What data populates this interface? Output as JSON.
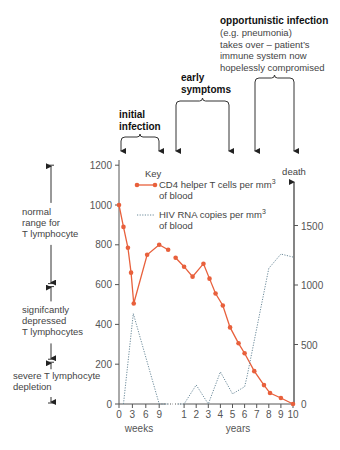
{
  "chart_data": {
    "type": "line",
    "title": "",
    "xlabel_left": "weeks",
    "xlabel_right": "years",
    "ylabel_left": "CD4 helper T cells per mm3 of blood",
    "ylabel_right": "HIV RNA copies per mm3 of blood",
    "ylim_left": [
      0,
      1200
    ],
    "ylim_right": [
      0,
      1700
    ],
    "yticks_left": [
      0,
      200,
      400,
      600,
      800,
      1000,
      1200
    ],
    "yticks_right": [
      0,
      500,
      1000,
      1500
    ],
    "xticks_weeks": [
      0,
      3,
      6,
      9
    ],
    "xticks_years": [
      1,
      2,
      3,
      4,
      5,
      6,
      7,
      8,
      9,
      10
    ],
    "legend": {
      "title": "Key",
      "entries": [
        {
          "label": "CD4 helper T cells per mm",
          "sup": "3",
          "label2": "of blood",
          "style": "solid-dot",
          "color": "#e8603c"
        },
        {
          "label": "HIV RNA copies per mm",
          "sup": "3",
          "label2": "of blood",
          "style": "dotted",
          "color": "#6b8a9a"
        }
      ]
    },
    "series": [
      {
        "name": "CD4 helper T cells per mm3 of blood",
        "axis": "left",
        "segments": [
          {
            "unit": "weeks",
            "x": [
              0,
              1,
              2,
              2.7,
              3.3,
              6.3,
              9,
              11
            ],
            "y": [
              1000,
              890,
              785,
              660,
              505,
              750,
              800,
              775
            ]
          },
          {
            "unit": "years",
            "x": [
              0.3,
              1,
              1.7,
              2.6,
              3.1,
              3.6,
              4.2,
              4.8,
              5.5,
              6,
              6.8,
              7.6,
              8.1,
              9,
              10
            ],
            "y": [
              735,
              690,
              640,
              705,
              630,
              555,
              495,
              385,
              305,
              255,
              165,
              95,
              55,
              30,
              0
            ]
          }
        ]
      },
      {
        "name": "HIV RNA copies per mm3 of blood",
        "axis": "right",
        "segments": [
          {
            "unit": "weeks",
            "x": [
              1,
              3.2,
              9,
              11
            ],
            "y": [
              0,
              760,
              0,
              0
            ]
          },
          {
            "unit": "years",
            "x": [
              0.5,
              1,
              2,
              3,
              4,
              5,
              6,
              6.2,
              8,
              9,
              10
            ],
            "y": [
              0,
              0,
              160,
              0,
              270,
              85,
              145,
              230,
              1140,
              1260,
              1235
            ]
          }
        ]
      }
    ],
    "annotations": {
      "phases": [
        {
          "lines": [
            "initial",
            "infection"
          ],
          "from_x_week": 0,
          "to_x_week": 9
        },
        {
          "lines": [
            "early",
            "symptoms"
          ],
          "from_x_year": 0.5,
          "to_x_year": 4.8
        },
        {
          "lines": [
            "opportunistic infection"
          ],
          "sub": [
            "(e.g. pneumonia)",
            "takes over – patient’s",
            "immune system now",
            "hopelessly compromised"
          ],
          "from_x_year": 6,
          "to_x_year": 9
        }
      ],
      "death_label": "death",
      "ranges": [
        {
          "lines": [
            "normal",
            "range for",
            "T lymphocyte"
          ],
          "from": 1200,
          "to": 600
        },
        {
          "lines": [
            "signifcantly",
            "depressed",
            "T lymphocytes"
          ],
          "from": 600,
          "to": 220
        },
        {
          "lines": [
            "severe T lymphocyte",
            "depletion"
          ],
          "from": 220,
          "to": 0
        }
      ]
    },
    "grid": false,
    "legend_position": "top-center inside"
  },
  "colors": {
    "cd4": "#e8603c",
    "hiv": "#6b8a9a",
    "axis": "#555555",
    "text": "#444444"
  }
}
